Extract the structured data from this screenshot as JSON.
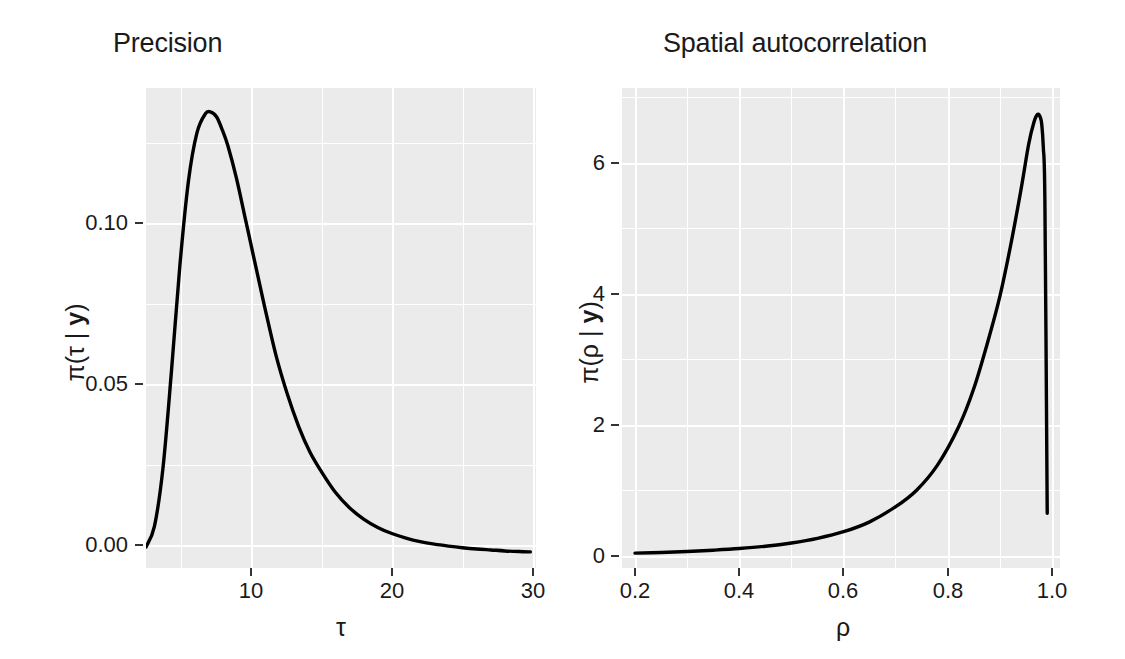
{
  "figure": {
    "background": "#ffffff",
    "panel_background": "#ebebeb",
    "gridline_color": "#ffffff",
    "curve_color": "#000000",
    "text_color": "#1a1a1a"
  },
  "panels": {
    "left": {
      "title": "Precision",
      "xlabel": "τ",
      "ylabel_prefix": "π(τ | ",
      "ylabel_bold": "y",
      "ylabel_suffix": ")",
      "x_ticks": [
        "10",
        "20",
        "30"
      ],
      "y_ticks": [
        "0.00",
        "0.05",
        "0.10"
      ]
    },
    "right": {
      "title": "Spatial autocorrelation",
      "xlabel": "ρ",
      "ylabel_prefix": "π(ρ | ",
      "ylabel_bold": "y",
      "ylabel_suffix": ")",
      "x_ticks": [
        "0.2",
        "0.4",
        "0.6",
        "0.8",
        "1.0"
      ],
      "y_ticks": [
        "0",
        "2",
        "4",
        "6"
      ]
    }
  },
  "chart_data": [
    {
      "type": "line",
      "title": "Precision",
      "xlabel": "τ",
      "ylabel": "π(τ | y)",
      "grid": true,
      "legend": "none",
      "xlim": [
        2.6,
        30.2
      ],
      "ylim": [
        -0.004,
        0.145
      ],
      "xticks": [
        10,
        20,
        30
      ],
      "yticks": [
        0.0,
        0.05,
        0.1
      ],
      "x": [
        2.6,
        3.2,
        3.8,
        4.4,
        5.0,
        5.6,
        6.2,
        6.8,
        7.2,
        7.6,
        8.0,
        8.4,
        9.0,
        9.6,
        10.2,
        11.0,
        11.8,
        12.6,
        13.4,
        14.2,
        15.0,
        16.0,
        17.0,
        18.0,
        19.0,
        20.0,
        21.0,
        22.0,
        23.0,
        24.0,
        25.0,
        26.0,
        27.0,
        28.0,
        29.0,
        29.8
      ],
      "y": [
        0.0025,
        0.009,
        0.027,
        0.057,
        0.09,
        0.116,
        0.131,
        0.137,
        0.1375,
        0.136,
        0.132,
        0.127,
        0.117,
        0.105,
        0.093,
        0.077,
        0.062,
        0.05,
        0.04,
        0.032,
        0.026,
        0.0195,
        0.0147,
        0.0112,
        0.0086,
        0.0067,
        0.0053,
        0.0042,
        0.0034,
        0.0028,
        0.0023,
        0.0019,
        0.0016,
        0.0013,
        0.0011,
        0.001
      ],
      "series": [
        {
          "name": "posterior density of tau",
          "values": [
            0.0025,
            0.009,
            0.027,
            0.057,
            0.09,
            0.116,
            0.131,
            0.137,
            0.1375,
            0.136,
            0.132,
            0.127,
            0.117,
            0.105,
            0.093,
            0.077,
            0.062,
            0.05,
            0.04,
            0.032,
            0.026,
            0.0195,
            0.0147,
            0.0112,
            0.0086,
            0.0067,
            0.0053,
            0.0042,
            0.0034,
            0.0028,
            0.0023,
            0.0019,
            0.0016,
            0.0013,
            0.0011,
            0.001
          ]
        }
      ],
      "peak": {
        "x": 7.4,
        "y": 0.1376
      }
    },
    {
      "type": "line",
      "title": "Spatial autocorrelation",
      "xlabel": "ρ",
      "ylabel": "π(ρ | y)",
      "grid": true,
      "legend": "none",
      "xlim": [
        0.175,
        1.015
      ],
      "ylim": [
        -0.18,
        7.1
      ],
      "xticks": [
        0.2,
        0.4,
        0.6,
        0.8,
        1.0
      ],
      "yticks": [
        0,
        2,
        4,
        6
      ],
      "x": [
        0.2,
        0.25,
        0.3,
        0.35,
        0.4,
        0.45,
        0.5,
        0.55,
        0.6,
        0.65,
        0.7,
        0.74,
        0.78,
        0.82,
        0.85,
        0.88,
        0.9,
        0.92,
        0.94,
        0.955,
        0.965,
        0.972,
        0.977,
        0.98,
        0.983,
        0.986,
        0.99,
        0.9905
      ],
      "y": [
        0.045,
        0.055,
        0.07,
        0.09,
        0.115,
        0.15,
        0.2,
        0.27,
        0.37,
        0.52,
        0.75,
        1.0,
        1.38,
        1.95,
        2.55,
        3.35,
        3.95,
        4.7,
        5.55,
        6.25,
        6.58,
        6.7,
        6.66,
        6.55,
        6.2,
        5.4,
        1.2,
        0.65
      ],
      "series": [
        {
          "name": "posterior density of rho",
          "values": [
            0.045,
            0.055,
            0.07,
            0.09,
            0.115,
            0.15,
            0.2,
            0.27,
            0.37,
            0.52,
            0.75,
            1.0,
            1.38,
            1.95,
            2.55,
            3.35,
            3.95,
            4.7,
            5.55,
            6.25,
            6.58,
            6.7,
            6.66,
            6.55,
            6.2,
            5.4,
            1.2,
            0.65
          ]
        }
      ],
      "peak": {
        "x": 0.972,
        "y": 6.7
      }
    }
  ]
}
